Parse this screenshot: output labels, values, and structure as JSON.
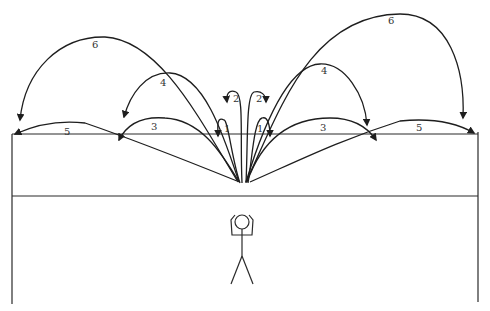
{
  "diagram": {
    "title": "",
    "trajectories": [
      {
        "id": "left-1",
        "label": "1",
        "side": "left"
      },
      {
        "id": "left-2",
        "label": "2",
        "side": "left"
      },
      {
        "id": "left-3",
        "label": "3",
        "side": "left"
      },
      {
        "id": "left-4",
        "label": "4",
        "side": "left"
      },
      {
        "id": "left-5",
        "label": "5",
        "side": "left"
      },
      {
        "id": "left-6",
        "label": "6",
        "side": "left"
      },
      {
        "id": "right-1",
        "label": "1",
        "side": "right"
      },
      {
        "id": "right-2",
        "label": "2",
        "side": "right"
      },
      {
        "id": "right-3",
        "label": "3",
        "side": "right"
      },
      {
        "id": "right-4",
        "label": "4",
        "side": "right"
      },
      {
        "id": "right-5",
        "label": "5",
        "side": "right"
      },
      {
        "id": "right-6",
        "label": "6",
        "side": "right"
      }
    ],
    "figure": "stick-figure-person-arms-raised",
    "colors": {
      "ink": "#1e1e1e",
      "background": "#ffffff"
    }
  }
}
